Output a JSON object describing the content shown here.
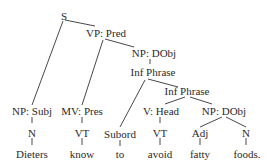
{
  "diagram": {
    "type": "syntax-tree",
    "nodes": {
      "s": "S",
      "vp_pred": "VP: Pred",
      "np_dobj_1": "NP: DObj",
      "inf_phrase_1": "Inf Phrase",
      "inf_phrase_2": "Inf Phrase",
      "np_subj": "NP: Subj",
      "mv_pres": "MV: Pres",
      "subord": "Subord",
      "v_head": "V: Head",
      "np_dobj_2": "NP: DObj",
      "n_1": "N",
      "vt_1": "VT",
      "vt_2": "VT",
      "adj": "Adj",
      "n_2": "N"
    },
    "words": [
      "Dieters",
      "know",
      "to",
      "avoid",
      "fatty",
      "foods."
    ],
    "line_color": "#2a2a2a"
  }
}
